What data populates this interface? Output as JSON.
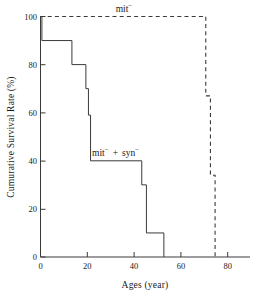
{
  "chart_data": {
    "type": "line",
    "subtype": "kaplan-meier-step",
    "title": "",
    "xlabel": "Ages  (year)",
    "ylabel": "Cumurative Survival Rate  (%)",
    "xlim": [
      0,
      90
    ],
    "ylim": [
      0,
      100
    ],
    "xticks": [
      0,
      20,
      40,
      60,
      80
    ],
    "yticks": [
      0,
      20,
      40,
      60,
      80,
      100
    ],
    "xtick_labels": [
      "0",
      "20",
      "40",
      "60",
      "80"
    ],
    "ytick_labels": [
      "0",
      "20",
      "40",
      "60",
      "80",
      "100"
    ],
    "grid": false,
    "legend": "inline-annotations",
    "series": [
      {
        "name": "mit-",
        "label_text": "mit",
        "label_sup": "−",
        "style": "dashed",
        "color": "#3a3a3a",
        "label_x": 45,
        "label_y": 103,
        "points": [
          {
            "x": 0,
            "y": 100
          },
          {
            "x": 71,
            "y": 100
          },
          {
            "x": 71,
            "y": 67
          },
          {
            "x": 73,
            "y": 67
          },
          {
            "x": 73,
            "y": 34
          },
          {
            "x": 75,
            "y": 34
          },
          {
            "x": 75,
            "y": 0
          }
        ]
      },
      {
        "name": "mit- + syn-",
        "label_text_1": "mit",
        "label_sup_1": "−",
        "label_plus": "+",
        "label_text_2": "syn",
        "label_sup_2": "−",
        "style": "solid",
        "color": "#3a3a3a",
        "label_x": 22,
        "label_y": 45,
        "points": [
          {
            "x": 0,
            "y": 100
          },
          {
            "x": 0.6,
            "y": 100
          },
          {
            "x": 0.6,
            "y": 90
          },
          {
            "x": 13.5,
            "y": 90
          },
          {
            "x": 13.5,
            "y": 80
          },
          {
            "x": 19.5,
            "y": 80
          },
          {
            "x": 19.5,
            "y": 70
          },
          {
            "x": 20.6,
            "y": 70
          },
          {
            "x": 20.6,
            "y": 59
          },
          {
            "x": 21.5,
            "y": 59
          },
          {
            "x": 21.5,
            "y": 40
          },
          {
            "x": 43.5,
            "y": 40
          },
          {
            "x": 43.5,
            "y": 30
          },
          {
            "x": 45.5,
            "y": 30
          },
          {
            "x": 45.5,
            "y": 10
          },
          {
            "x": 53,
            "y": 10
          },
          {
            "x": 53,
            "y": 0
          }
        ]
      }
    ]
  },
  "figure": {
    "background_color": "#ffffff",
    "axis_color": "#3a3a3a",
    "text_color": "#1a1a1a"
  }
}
